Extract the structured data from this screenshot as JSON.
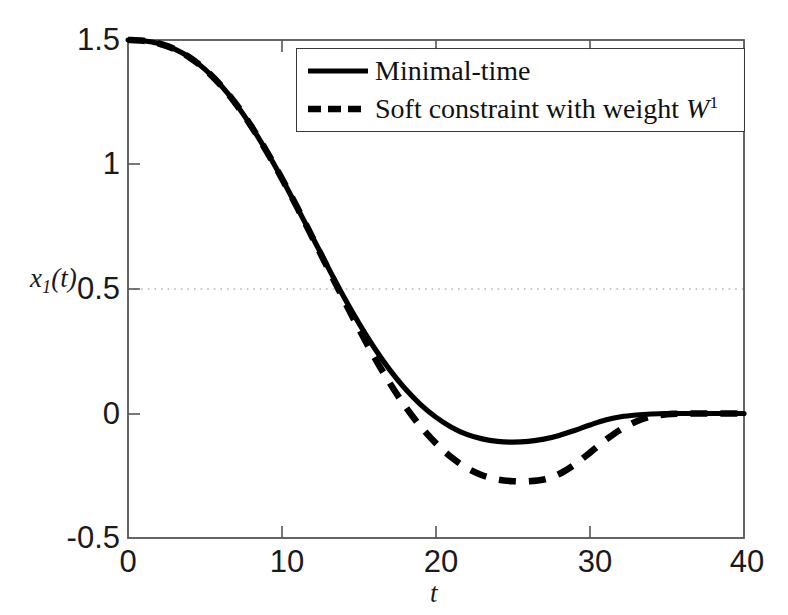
{
  "chart_data": {
    "type": "line",
    "title": "",
    "subtitle": "",
    "xlabel": "t",
    "ylabel": "x_1(t)",
    "ylabel_base": "x",
    "ylabel_sub": "1",
    "ylabel_tail": "(t)",
    "xlim": [
      0,
      40
    ],
    "ylim": [
      -0.5,
      1.5
    ],
    "xticks": [
      0,
      10,
      20,
      30,
      40
    ],
    "xtick_labels": [
      "0",
      "10",
      "20",
      "30",
      "40"
    ],
    "yticks": [
      -0.5,
      0,
      0.5,
      1,
      1.5
    ],
    "ytick_labels": [
      "-0.5",
      "0",
      "0.5",
      "1",
      "1.5"
    ],
    "grid": false,
    "gridlines_horizontal": [
      0.5
    ],
    "gridline_style": "dotted",
    "gridline_color": "#b4b4b4",
    "legend_position": "upper right",
    "legend_entries": [
      {
        "label": "Minimal-time",
        "style": "solid",
        "color": "#000000"
      },
      {
        "label_prefix": "Soft constraint with weight ",
        "label_symbol": "W",
        "label_sup": "1",
        "style": "dashed",
        "color": "#000000"
      }
    ],
    "series": [
      {
        "name": "Minimal-time",
        "style": "solid",
        "color": "#000000",
        "x": [
          0,
          1,
          2,
          3,
          4,
          5,
          6,
          7,
          8,
          9,
          10,
          11,
          12,
          13,
          14,
          15,
          16,
          17,
          18,
          19,
          20,
          21,
          22,
          23,
          24,
          25,
          26,
          27,
          28,
          29,
          30,
          31,
          32,
          33,
          34,
          35,
          36,
          37,
          38,
          39,
          40
        ],
        "y": [
          1.5,
          1.497,
          1.486,
          1.464,
          1.43,
          1.382,
          1.32,
          1.244,
          1.154,
          1.053,
          0.943,
          0.826,
          0.706,
          0.586,
          0.47,
          0.362,
          0.263,
          0.175,
          0.099,
          0.036,
          -0.015,
          -0.055,
          -0.084,
          -0.102,
          -0.112,
          -0.115,
          -0.112,
          -0.103,
          -0.088,
          -0.068,
          -0.046,
          -0.026,
          -0.013,
          -0.006,
          -0.002,
          0.0,
          0.0,
          0.0,
          0.0,
          0.0,
          0.0
        ]
      },
      {
        "name": "Soft constraint with weight W^1",
        "style": "dashed",
        "color": "#000000",
        "x": [
          0,
          1,
          2,
          3,
          4,
          5,
          6,
          7,
          8,
          9,
          10,
          11,
          12,
          13,
          14,
          15,
          16,
          17,
          18,
          19,
          20,
          21,
          22,
          23,
          24,
          25,
          26,
          27,
          28,
          29,
          30,
          31,
          32,
          33,
          34,
          35,
          36,
          37,
          38,
          39,
          40
        ],
        "y": [
          1.5,
          1.497,
          1.486,
          1.464,
          1.43,
          1.382,
          1.32,
          1.244,
          1.154,
          1.053,
          0.943,
          0.826,
          0.704,
          0.581,
          0.458,
          0.339,
          0.226,
          0.122,
          0.029,
          -0.052,
          -0.12,
          -0.176,
          -0.219,
          -0.248,
          -0.265,
          -0.272,
          -0.272,
          -0.265,
          -0.243,
          -0.205,
          -0.157,
          -0.107,
          -0.064,
          -0.032,
          -0.012,
          -0.003,
          0.0,
          0.0,
          0.0,
          0.0,
          0.0
        ]
      }
    ],
    "annotations": [
      {
        "text": "horizontal dotted reference line at y = 0.5",
        "value": 0.5
      }
    ],
    "key_points": {
      "initial_value": 1.5,
      "solid_min_value": -0.115,
      "solid_min_t": 25.4,
      "dashed_min_value": -0.272,
      "dashed_min_t": 26.3,
      "curves_diverge_t": 14,
      "solid_settles_t": 31,
      "dashed_settles_t": 35,
      "crossing_half_t": 14.2
    }
  },
  "axes": {
    "frame_color": "#4d4d4d",
    "background": "#ffffff"
  }
}
